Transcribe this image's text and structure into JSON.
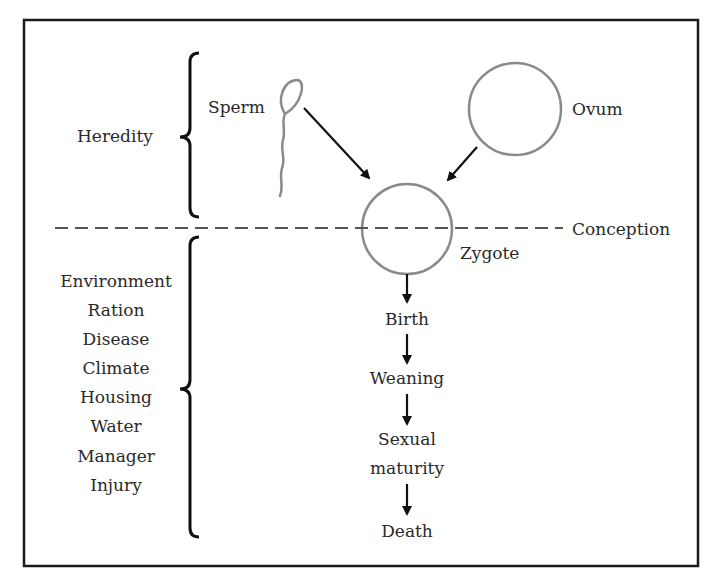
{
  "diagram": {
    "frame": {
      "border_color": "#1a1a1a"
    },
    "colors": {
      "cell_stroke": "#8a8a8a",
      "arrow": "#111111",
      "dash": "#555555",
      "text": "#2a2a2a"
    },
    "heredity": {
      "label": "Heredity",
      "sperm_label": "Sperm",
      "ovum_label": "Ovum"
    },
    "conception": {
      "label": "Conception",
      "zygote_label": "Zygote"
    },
    "environment": {
      "factors": [
        "Environment",
        "Ration",
        "Disease",
        "Climate",
        "Housing",
        "Water",
        "Manager",
        "Injury"
      ]
    },
    "life_stages": [
      "Birth",
      "Weaning",
      "Sexual",
      "maturity",
      "Death"
    ],
    "icons": {
      "sperm": "sperm-icon",
      "ovum": "ovum-circle",
      "zygote": "zygote-circle",
      "arrow": "arrow-down-icon",
      "brace": "left-brace-icon"
    }
  }
}
